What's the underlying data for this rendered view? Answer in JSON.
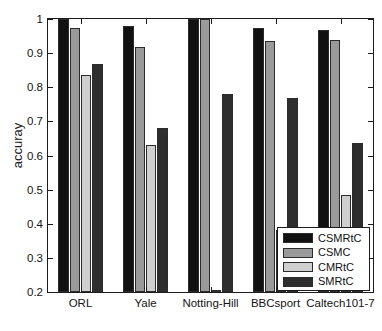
{
  "chart_data": {
    "type": "bar",
    "title": "",
    "subtitle": "",
    "xlabel": "",
    "ylabel": "accuray",
    "categories": [
      "ORL",
      "Yale",
      "Notting-Hill",
      "BBCsport",
      "Caltech101-7"
    ],
    "series": [
      {
        "name": "CSMRtC",
        "color": "#111111",
        "values": [
          1.0,
          0.98,
          1.0,
          0.973,
          0.968
        ]
      },
      {
        "name": "CSMC",
        "color": "#9a9a9a",
        "values": [
          0.975,
          0.917,
          1.0,
          0.937,
          0.938
        ]
      },
      {
        "name": "CMRtC",
        "color": "#cfcfcf",
        "values": [
          0.835,
          0.632,
          0.205,
          0.383,
          0.485
        ]
      },
      {
        "name": "SMRtC",
        "color": "#2e2e2e",
        "values": [
          0.868,
          0.682,
          0.779,
          0.77,
          0.638
        ]
      }
    ],
    "ylim": [
      0.2,
      1.0
    ],
    "yticks": [
      0.2,
      0.3,
      0.4,
      0.5,
      0.6,
      0.7,
      0.8,
      0.9,
      1.0
    ],
    "ytick_labels": [
      "0.2",
      "0.3",
      "0.4",
      "0.5",
      "0.6",
      "0.7",
      "0.8",
      "0.9",
      "1"
    ],
    "grid": false,
    "legend_position": "bottom-right",
    "legend_entries": [
      "CSMRtC",
      "CSMC",
      "CMRtC",
      "SMRtC"
    ]
  }
}
